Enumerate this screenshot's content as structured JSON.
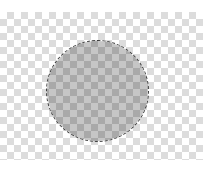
{
  "canvas": {
    "background_color": "#ffffff",
    "transparency_grid": {
      "light_color": "#ffffff",
      "dark_color": "#d9d9d9",
      "cell_size_px": 7
    }
  },
  "selection": {
    "shape": "ellipse",
    "left": 47,
    "top": 41,
    "width": 101,
    "height": 100,
    "fill_light_color": "#c6c6c6",
    "fill_dark_color": "#a9a9a9",
    "outline_style": "marching-ants",
    "outline_color": "#3a3a3a"
  }
}
